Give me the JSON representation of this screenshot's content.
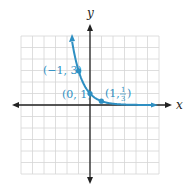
{
  "chart_data": {
    "type": "line",
    "title": "",
    "function": "y = (1/3)^x",
    "xlabel": "x",
    "ylabel": "y",
    "xlim": [
      -6,
      6
    ],
    "ylim": [
      -6,
      6
    ],
    "grid": true,
    "series": [
      {
        "name": "y = (1/3)^x",
        "color": "#2e8fc2",
        "x": [
          -1.6,
          -1.5,
          -1,
          -0.5,
          0,
          0.5,
          1,
          2,
          3,
          4,
          5,
          5.6
        ],
        "y": [
          5.8,
          5.2,
          3,
          1.73,
          1,
          0.58,
          0.333,
          0.111,
          0.037,
          0.012,
          0.004,
          0.002
        ]
      }
    ],
    "points": [
      {
        "x": -1,
        "y": 3,
        "label": "(−1, 3)"
      },
      {
        "x": 0,
        "y": 1,
        "label": "(0, 1)"
      },
      {
        "x": 1,
        "y": 0.3333,
        "label": "(1, 1/3)"
      }
    ]
  },
  "labels": {
    "x_axis": "x",
    "y_axis": "y",
    "p1": "(−1, 3)",
    "p2": "(0, 1)",
    "p3_open": "(1, ",
    "p3_num": "1",
    "p3_den": "3",
    "p3_close": ")"
  }
}
